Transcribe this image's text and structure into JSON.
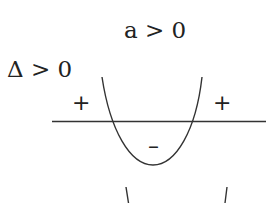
{
  "diagram": {
    "title": "a > 0",
    "condition": "Δ > 0",
    "signs": {
      "left": "+",
      "right": "+",
      "middle": "–"
    },
    "colors": {
      "stroke": "#333333",
      "text": "#222222",
      "background": "#ffffff"
    }
  }
}
